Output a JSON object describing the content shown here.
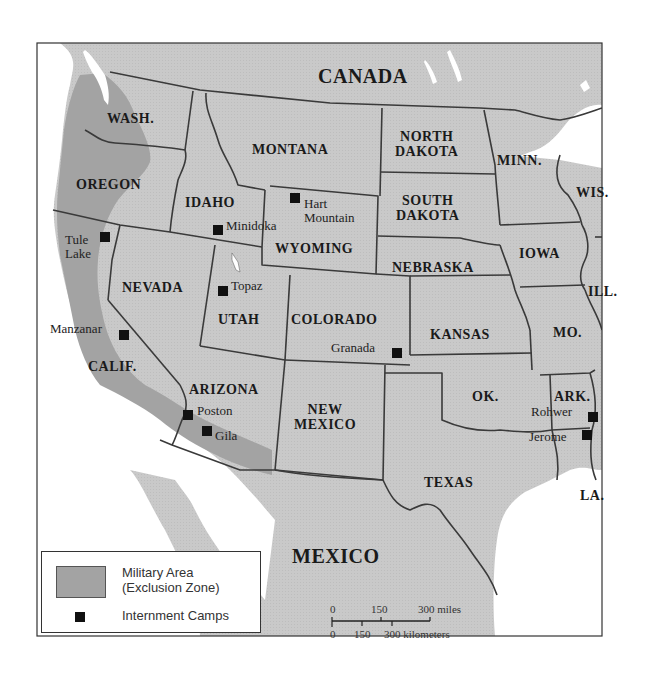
{
  "map": {
    "title_regions": {
      "canada": "CANADA",
      "mexico": "MEXICO"
    },
    "states": [
      {
        "id": "wash",
        "label": "WASH."
      },
      {
        "id": "oregon",
        "label": "OREGON"
      },
      {
        "id": "idaho",
        "label": "IDAHO"
      },
      {
        "id": "montana",
        "label": "MONTANA"
      },
      {
        "id": "wyoming",
        "label": "WYOMING"
      },
      {
        "id": "north_dakota",
        "label": "NORTH\nDAKOTA"
      },
      {
        "id": "south_dakota",
        "label": "SOUTH\nDAKOTA"
      },
      {
        "id": "minn",
        "label": "MINN."
      },
      {
        "id": "wis",
        "label": "WIS."
      },
      {
        "id": "iowa",
        "label": "IOWA"
      },
      {
        "id": "ill",
        "label": "ILL."
      },
      {
        "id": "nebraska",
        "label": "NEBRASKA"
      },
      {
        "id": "nevada",
        "label": "NEVADA"
      },
      {
        "id": "utah",
        "label": "UTAH"
      },
      {
        "id": "colorado",
        "label": "COLORADO"
      },
      {
        "id": "kansas",
        "label": "KANSAS"
      },
      {
        "id": "mo",
        "label": "MO."
      },
      {
        "id": "calif",
        "label": "CALIF."
      },
      {
        "id": "arizona",
        "label": "ARIZONA"
      },
      {
        "id": "new_mexico",
        "label": "NEW\nMEXICO"
      },
      {
        "id": "ok",
        "label": "OK."
      },
      {
        "id": "ark",
        "label": "ARK."
      },
      {
        "id": "texas",
        "label": "TEXAS"
      },
      {
        "id": "la",
        "label": "LA."
      }
    ],
    "camps": [
      {
        "id": "tule_lake",
        "label": "Tule\nLake"
      },
      {
        "id": "minidoka",
        "label": "Minidoka"
      },
      {
        "id": "hart_mountain",
        "label": "Hart\nMountain"
      },
      {
        "id": "topaz",
        "label": "Topaz"
      },
      {
        "id": "manzanar",
        "label": "Manzanar"
      },
      {
        "id": "granada",
        "label": "Granada"
      },
      {
        "id": "poston",
        "label": "Poston"
      },
      {
        "id": "gila",
        "label": "Gila"
      },
      {
        "id": "rohwer",
        "label": "Rohwer"
      },
      {
        "id": "jerome",
        "label": "Jerome"
      }
    ],
    "legend": {
      "military_area_line1": "Military Area",
      "military_area_line2": "(Exclusion Zone)",
      "camps": "Internment Camps"
    },
    "scale": {
      "miles_ticks": [
        "0",
        "150",
        "300 miles"
      ],
      "km_ticks": [
        "0",
        "150",
        "300 kilometers"
      ]
    },
    "colors": {
      "land": "#c9c9c9",
      "exclusion_zone": "#a3a3a3",
      "water": "#ffffff",
      "border": "#3a3a3a"
    }
  }
}
